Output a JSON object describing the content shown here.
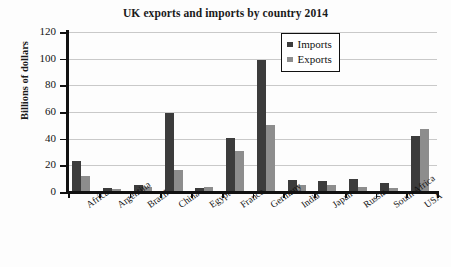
{
  "chart_data": {
    "type": "bar",
    "title": "UK exports and imports by country 2014",
    "xlabel": "",
    "ylabel": "Billions of dollars",
    "ylim": [
      0,
      120
    ],
    "yticks": [
      0,
      20,
      40,
      60,
      80,
      100,
      120
    ],
    "grid": true,
    "legend_position": "top-right",
    "categories": [
      "Africa",
      "Argentina",
      "Brazil",
      "China",
      "Egypt",
      "France",
      "Germany",
      "India",
      "Japan",
      "Russia",
      "South Africa",
      "USA"
    ],
    "series": [
      {
        "name": "Imports",
        "color": "#3c3c3c",
        "values": [
          23.5,
          3,
          5,
          59.5,
          3,
          40.5,
          99,
          9,
          8,
          9.5,
          7,
          42
        ]
      },
      {
        "name": "Exports",
        "color": "#8d8d8d",
        "values": [
          12,
          2.5,
          4,
          16.5,
          3.5,
          31,
          50.5,
          5.5,
          5.5,
          3.5,
          3,
          47.5
        ]
      }
    ]
  },
  "legend": {
    "entries": [
      {
        "label": "Imports",
        "swatch": "imports-swatch"
      },
      {
        "label": "Exports",
        "swatch": "exports-swatch"
      }
    ]
  }
}
